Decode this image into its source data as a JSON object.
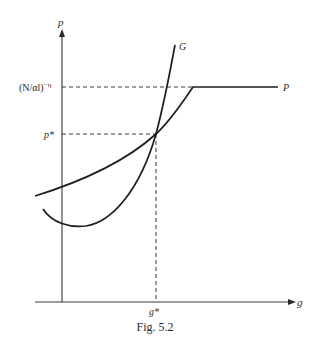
{
  "figure": {
    "caption": "Fig. 5.2",
    "y_axis_label": "p",
    "x_axis_label": "g",
    "y_tick_upper": "(N/αl)",
    "y_tick_upper_exp": "−η",
    "y_tick_equilibrium": "p*",
    "x_tick_equilibrium": "g*",
    "curve_labels": {
      "G": "G",
      "P": "P"
    },
    "colors": {
      "ink": "#1e1e1e",
      "background": "#ffffff"
    }
  }
}
